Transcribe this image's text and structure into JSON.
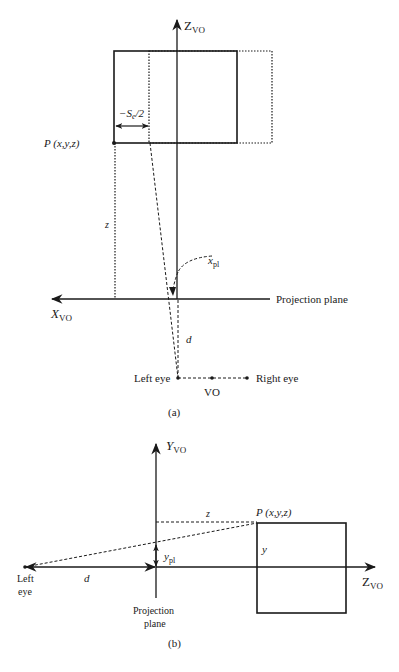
{
  "panel_a": {
    "caption": "(a)",
    "z_axis_label": "Z",
    "z_axis_sub": "VO",
    "x_axis_label": "X",
    "x_axis_sub": "VO",
    "point_label": "P (x,y,z)",
    "offset_label": "−S",
    "offset_sub": "e",
    "offset_tail": "/2",
    "z_label": "z",
    "xpl_label": "x",
    "xpl_sub": "pl",
    "projection_plane_label": "Projection plane",
    "d_label": "d",
    "left_eye_label": "Left eye",
    "right_eye_label": "Right eye",
    "vo_label": "VO"
  },
  "panel_b": {
    "caption": "(b)",
    "y_axis_label": "Y",
    "y_axis_sub": "VO",
    "z_axis_label": "Z",
    "z_axis_sub": "VO",
    "point_label": "P (x,y,z)",
    "z_label": "z",
    "y_label": "y",
    "ypl_label": "y",
    "ypl_sub": "pl",
    "d_label": "d",
    "left_eye_line1": "Left",
    "left_eye_line2": "eye",
    "projection_line1": "Projection",
    "projection_line2": "plane"
  }
}
